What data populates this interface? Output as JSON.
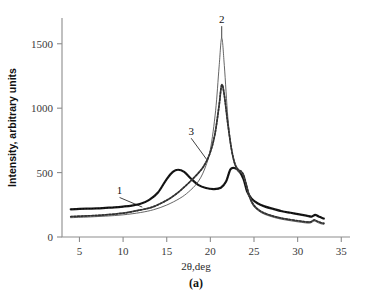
{
  "figure": {
    "caption": "(a)"
  },
  "chart_data": {
    "type": "line",
    "title": "",
    "xlabel": "2θ,deg",
    "ylabel": "Intensity, arbitrary units",
    "xlim": [
      3.0,
      36.0
    ],
    "ylim": [
      0,
      1700
    ],
    "xticks": [
      5,
      10,
      15,
      20,
      25,
      30,
      35
    ],
    "xtick_labels": [
      "5",
      "10",
      "15",
      "20",
      "25",
      "30",
      "35"
    ],
    "yticks": [
      0,
      500,
      1000,
      1500
    ],
    "ytick_labels": [
      "0",
      "500",
      "1000",
      "1500"
    ],
    "grid": false,
    "legend": "none",
    "annotations": [
      {
        "text": "1",
        "x": 9.6,
        "y": 330,
        "points_to_x": 12.2,
        "points_to_y": 232
      },
      {
        "text": "2",
        "x": 21.3,
        "y": 1660,
        "points_to_x": 21.3,
        "points_to_y": 1545
      },
      {
        "text": "3",
        "x": 17.8,
        "y": 790,
        "points_to_x": 19.6,
        "points_to_y": 600
      }
    ],
    "series": [
      {
        "name": "1",
        "style": "thick-solid-dark",
        "x": [
          4.0,
          5.0,
          6.0,
          7.0,
          8.0,
          9.0,
          10.0,
          11.0,
          12.0,
          13.0,
          14.0,
          15.0,
          15.7,
          16.3,
          17.0,
          17.8,
          18.6,
          19.5,
          20.4,
          21.2,
          21.8,
          22.3,
          22.8,
          23.3,
          23.8,
          24.2,
          24.7,
          25.4,
          26.2,
          27.2,
          28.2,
          29.2,
          30.2,
          31.0,
          31.6,
          32.0,
          32.4,
          32.8,
          33.0
        ],
        "y": [
          215,
          218,
          220,
          222,
          226,
          230,
          236,
          244,
          258,
          288,
          345,
          450,
          505,
          522,
          505,
          452,
          405,
          380,
          372,
          382,
          430,
          525,
          535,
          512,
          450,
          355,
          300,
          262,
          238,
          218,
          200,
          188,
          176,
          166,
          158,
          172,
          160,
          148,
          143
        ]
      },
      {
        "name": "2",
        "style": "thin-solid",
        "x": [
          4.0,
          6.0,
          8.0,
          10.0,
          12.0,
          13.5,
          15.0,
          16.5,
          17.5,
          18.5,
          19.3,
          20.0,
          20.6,
          21.0,
          21.3,
          21.6,
          22.0,
          22.4,
          22.8,
          23.2,
          23.5,
          23.8,
          24.1,
          24.5,
          25.0,
          25.8,
          26.8,
          28.0,
          29.2,
          30.4,
          31.4,
          31.9,
          32.3,
          32.7,
          33.0
        ],
        "y": [
          150,
          155,
          162,
          172,
          190,
          212,
          248,
          300,
          350,
          420,
          520,
          680,
          980,
          1320,
          1545,
          1330,
          930,
          690,
          560,
          505,
          500,
          470,
          400,
          300,
          235,
          190,
          162,
          140,
          126,
          114,
          108,
          124,
          112,
          102,
          98
        ]
      },
      {
        "name": "3",
        "style": "medium-solid-with-markers",
        "x": [
          4.0,
          6.0,
          8.0,
          10.0,
          12.0,
          13.5,
          15.0,
          16.0,
          16.8,
          17.6,
          18.4,
          19.2,
          19.9,
          20.5,
          21.0,
          21.3,
          21.6,
          22.0,
          22.4,
          22.8,
          23.2,
          23.5,
          23.8,
          24.1,
          24.5,
          25.0,
          25.8,
          26.8,
          28.0,
          29.2,
          30.4,
          31.4,
          31.9,
          32.3,
          32.7,
          33.0
        ],
        "y": [
          158,
          164,
          172,
          185,
          210,
          236,
          285,
          330,
          375,
          425,
          480,
          545,
          640,
          790,
          1020,
          1180,
          1100,
          880,
          690,
          570,
          520,
          512,
          482,
          412,
          312,
          245,
          198,
          170,
          148,
          134,
          122,
          116,
          132,
          120,
          110,
          106
        ]
      }
    ]
  }
}
